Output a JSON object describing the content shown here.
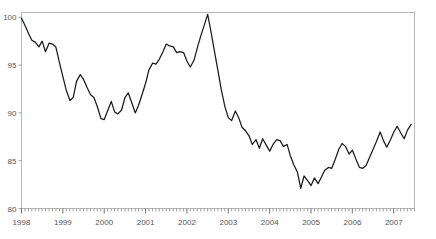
{
  "chart_data": {
    "type": "line",
    "title": "",
    "subtitle": "",
    "xlabel": "",
    "ylabel": "",
    "xlim": [
      1998.0,
      2007.5
    ],
    "ylim": [
      80,
      100.5
    ],
    "yticks": [
      80,
      85,
      90,
      95,
      100
    ],
    "ytick_labels": [
      "80",
      "85",
      "90",
      "95",
      "100"
    ],
    "xticks": [
      1998,
      1999,
      2000,
      2001,
      2002,
      2003,
      2004,
      2005,
      2006,
      2007
    ],
    "xtick_labels": [
      "1998",
      "1999",
      "2000",
      "2001",
      "2002",
      "2003",
      "2004",
      "2005",
      "2006",
      "2007"
    ],
    "minor_tick_interval": 0.0833,
    "grid": false,
    "legend": null,
    "legend_position": "none",
    "line_color": "#1a1a1a",
    "axis_color": "#b9b9b9",
    "tick_label_color": "#555555",
    "series": [
      {
        "name": "index",
        "x": [
          1998.0,
          1998.08,
          1998.17,
          1998.25,
          1998.33,
          1998.42,
          1998.5,
          1998.58,
          1998.67,
          1998.75,
          1998.83,
          1998.92,
          1999.0,
          1999.08,
          1999.17,
          1999.25,
          1999.33,
          1999.42,
          1999.5,
          1999.58,
          1999.67,
          1999.75,
          1999.83,
          1999.92,
          2000.0,
          2000.08,
          2000.17,
          2000.25,
          2000.33,
          2000.42,
          2000.5,
          2000.58,
          2000.67,
          2000.75,
          2000.83,
          2000.92,
          2001.0,
          2001.08,
          2001.17,
          2001.25,
          2001.33,
          2001.42,
          2001.5,
          2001.58,
          2001.67,
          2001.75,
          2001.83,
          2001.92,
          2002.0,
          2002.08,
          2002.17,
          2002.25,
          2002.33,
          2002.42,
          2002.5,
          2002.58,
          2002.67,
          2002.75,
          2002.83,
          2002.92,
          2003.0,
          2003.08,
          2003.17,
          2003.25,
          2003.33,
          2003.42,
          2003.5,
          2003.58,
          2003.67,
          2003.75,
          2003.83,
          2003.92,
          2004.0,
          2004.08,
          2004.17,
          2004.25,
          2004.33,
          2004.42,
          2004.5,
          2004.58,
          2004.67,
          2004.75,
          2004.83,
          2004.92,
          2005.0,
          2005.08,
          2005.17,
          2005.25,
          2005.33,
          2005.42,
          2005.5,
          2005.58,
          2005.67,
          2005.75,
          2005.83,
          2005.92,
          2006.0,
          2006.08,
          2006.17,
          2006.25,
          2006.33,
          2006.42,
          2006.5,
          2006.58,
          2006.67,
          2006.75,
          2006.83,
          2006.92,
          2007.0,
          2007.08,
          2007.17,
          2007.25,
          2007.33,
          2007.42
        ],
        "values": [
          99.9,
          99.2,
          98.3,
          97.6,
          97.4,
          96.9,
          97.5,
          96.4,
          97.3,
          97.2,
          96.9,
          95.2,
          93.8,
          92.4,
          91.3,
          91.6,
          93.3,
          94.0,
          93.5,
          92.7,
          91.9,
          91.6,
          90.7,
          89.4,
          89.3,
          90.2,
          91.2,
          90.1,
          89.9,
          90.3,
          91.6,
          92.1,
          91.0,
          90.0,
          90.8,
          92.0,
          93.1,
          94.5,
          95.2,
          95.1,
          95.6,
          96.4,
          97.2,
          97.0,
          96.9,
          96.3,
          96.4,
          96.3,
          95.4,
          94.8,
          95.5,
          96.8,
          98.0,
          99.2,
          100.3,
          98.5,
          96.3,
          94.4,
          92.4,
          90.6,
          89.5,
          89.2,
          90.2,
          89.5,
          88.5,
          88.1,
          87.6,
          86.7,
          87.2,
          86.3,
          87.3,
          86.6,
          86.0,
          86.7,
          87.2,
          87.1,
          86.5,
          86.7,
          85.5,
          84.6,
          83.8,
          82.1,
          83.4,
          82.9,
          82.4,
          83.2,
          82.6,
          83.3,
          84.0,
          84.3,
          84.2,
          85.1,
          86.2,
          86.8,
          86.5,
          85.7,
          86.1,
          85.2,
          84.3,
          84.2,
          84.5,
          85.4,
          86.2,
          87.0,
          88.0,
          87.1,
          86.4,
          87.2,
          88.0,
          88.6,
          87.9,
          87.3,
          88.2,
          88.8
        ]
      }
    ]
  },
  "axis": {
    "y_labels": [
      "100",
      "95",
      "90",
      "85",
      "80"
    ],
    "x_labels": [
      "1998",
      "1999",
      "2000",
      "2001",
      "2002",
      "2003",
      "2004",
      "2005",
      "2006",
      "2007"
    ]
  }
}
